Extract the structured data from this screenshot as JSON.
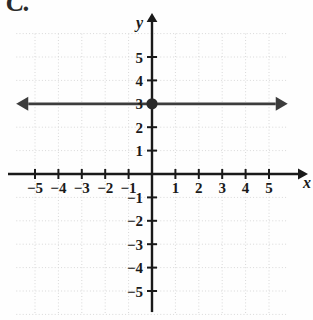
{
  "figure": {
    "problem_label": "C.",
    "axis_x_name": "x",
    "axis_y_name": "y"
  },
  "chart_data": {
    "type": "line",
    "title": "",
    "subtitle": "",
    "xlabel": "x",
    "ylabel": "y",
    "xlim": [
      -5.8,
      5.8
    ],
    "ylim": [
      -6.0,
      6.0
    ],
    "grid": true,
    "grid_spacing": 1,
    "grid_style": "dotted",
    "legend": "none",
    "x_ticks": [
      -5,
      -4,
      -3,
      -2,
      -1,
      1,
      2,
      3,
      4,
      5
    ],
    "y_ticks": [
      5,
      4,
      3,
      2,
      1,
      -1,
      -2,
      -3,
      -4,
      -5
    ],
    "x_tick_labels": [
      "−5",
      "−4",
      "−3",
      "−2",
      "−1",
      "1",
      "2",
      "3",
      "4",
      "5"
    ],
    "y_tick_labels": [
      "5",
      "4",
      "3",
      "2",
      "1",
      "−1",
      "−2",
      "−3",
      "−4",
      "−5"
    ],
    "series": [
      {
        "name": "y = 3",
        "type": "line",
        "equation": "y = 3",
        "slope": 0,
        "intercept": 3,
        "arrows": "both",
        "color": "#3c3c3c",
        "points": [
          {
            "x": -5.8,
            "y": 3
          },
          {
            "x": 5.8,
            "y": 3
          }
        ]
      },
      {
        "name": "plotted-point",
        "type": "scatter",
        "marker": "filled-circle",
        "color": "#2a2a2a",
        "points": [
          {
            "x": 0,
            "y": 3
          }
        ]
      }
    ],
    "annotations": []
  },
  "colors": {
    "axis": "#1a1a1a",
    "grid": "#d8d8d8",
    "line": "#3c3c3c",
    "point": "#2a2a2a",
    "background": "#fefefe"
  }
}
